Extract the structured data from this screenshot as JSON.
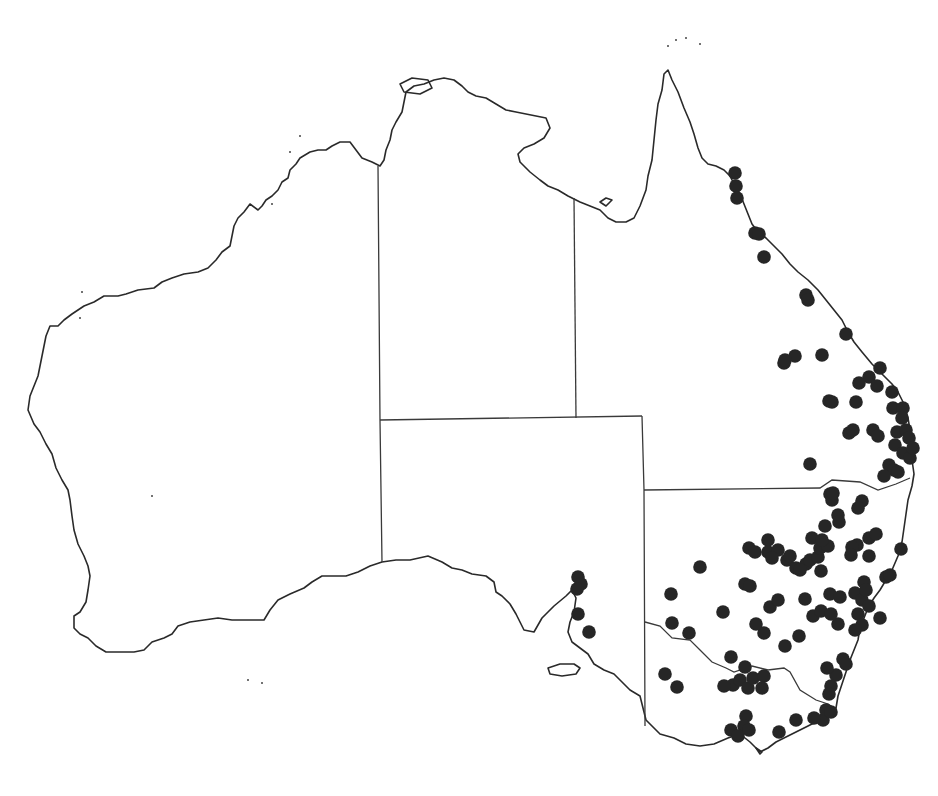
{
  "map": {
    "region": "Australia",
    "style": {
      "background": "#ffffff",
      "outline_color": "#2a2a2a",
      "dot_color": "#262626",
      "dot_radius": 6.8
    },
    "coastline": {
      "mainland": "M 380 166 L 372 162 L 362 158 L 356 150 L 350 142 L 340 142 L 332 146 L 326 150 L 318 150 L 310 152 L 300 158 L 296 164 L 290 170 L 288 178 L 282 182 L 278 190 L 272 196 L 266 200 L 262 206 L 258 210 L 250 204 L 244 212 L 238 218 L 234 226 L 232 236 L 230 246 L 222 252 L 216 260 L 208 268 L 198 272 L 184 274 L 172 278 L 162 282 L 154 288 L 138 290 L 126 294 L 118 296 L 104 296 L 94 302 L 84 306 L 72 314 L 64 320 L 58 326 L 50 326 L 46 336 L 44 346 L 42 356 L 40 366 L 38 376 L 34 386 L 30 396 L 28 410 L 34 424 L 40 432 L 46 444 L 52 454 L 56 468 L 62 480 L 68 490 L 70 500 L 72 516 L 74 530 L 78 544 L 84 556 L 88 566 L 90 576 L 88 590 L 86 602 L 80 612 L 74 616 L 74 628 L 80 634 L 88 638 L 96 646 L 106 652 L 120 652 L 134 652 L 144 650 L 152 642 L 164 638 L 172 634 L 178 626 L 190 622 L 204 620 L 218 618 L 232 620 L 248 620 L 264 620 L 270 610 L 278 600 L 290 594 L 304 588 L 312 582 L 322 576 L 334 576 L 346 576 L 358 572 L 370 566 L 382 562 L 396 560 L 410 560 L 428 556 L 442 562 L 452 568 L 462 570 L 472 574 L 486 576 L 494 582 L 496 592 L 502 596 L 510 604 L 516 614 L 520 622 L 524 630 L 534 632 L 542 618 L 554 606 L 566 596 L 572 590 L 576 598 L 574 612 L 570 622 L 568 632 L 572 642 L 580 648 L 588 654 L 594 664 L 604 670 L 614 674 L 622 682 L 630 690 L 640 696 L 646 720 L 660 734 L 674 738 L 686 744 L 700 746 L 714 744 L 728 738 L 740 734 L 750 742 L 760 752 L 768 748 L 776 742 L 788 736 L 800 730 L 812 724 L 822 720 L 830 716 L 836 708 L 838 696 L 842 684 L 846 672 L 850 660 L 854 650 L 858 640 L 860 628 L 864 618 L 868 608 L 874 598 L 880 590 L 886 580 L 892 570 L 898 556 L 902 542 L 904 528 L 906 514 L 908 500 L 912 486 L 914 474 L 912 460 L 912 444 L 910 430 L 908 418 L 904 404 L 898 392 L 892 384 L 882 374 L 872 364 L 862 352 L 854 342 L 848 332 L 842 320 L 834 310 L 826 300 L 818 290 L 808 280 L 798 272 L 790 264 L 782 254 L 774 246 L 766 238 L 758 232 L 752 224 L 748 214 L 744 204 L 740 194 L 734 184 L 730 176 L 724 170 L 716 166 L 708 164 L 702 158 L 698 148 L 694 134 L 690 122 L 684 108 L 678 92 L 672 80 L 668 70 L 664 74 L 662 90 L 658 104 L 656 120 L 654 140 L 652 160 L 648 176 L 646 190 L 640 206 L 634 218 L 626 222 L 616 222 L 608 218 L 600 210 L 590 206 L 580 202 L 568 196 L 558 190 L 548 186 L 540 180 L 530 172 L 520 162 L 518 154 L 524 148 L 534 144 L 544 138 L 550 128 L 546 118 L 536 116 L 526 114 L 516 112 L 506 110 L 496 104 L 486 98 L 476 96 L 468 92 L 462 86 L 454 80 L 444 78 L 434 80 L 424 84 L 414 86 L 406 92 L 404 102 L 402 112 L 396 122 L 392 130 L 390 140 L 386 150 L 384 160 Z",
      "kangaroo_island": "M 548 668 L 560 664 L 574 664 L 580 668 L 576 674 L 562 676 L 550 674 Z",
      "tasmania_tip": "M 756 748 L 760 754 L 762 752 Z",
      "gulf_islands": "M 600 202 L 606 198 L 612 200 L 606 206 Z",
      "tiwi_islands": "M 400 84 L 412 78 L 428 80 L 432 88 L 420 94 L 404 92 Z",
      "specks": [
        [
          668,
          46
        ],
        [
          676,
          40
        ],
        [
          686,
          38
        ],
        [
          700,
          44
        ],
        [
          82,
          292
        ],
        [
          80,
          318
        ],
        [
          152,
          496
        ],
        [
          248,
          680
        ],
        [
          262,
          683
        ],
        [
          300,
          136
        ],
        [
          290,
          152
        ],
        [
          272,
          204
        ]
      ]
    },
    "state_borders": [
      {
        "name": "wa-border",
        "d": "M 378 166 L 380 420 L 382 562"
      },
      {
        "name": "nt-sa-border",
        "d": "M 380 420 L 642 416"
      },
      {
        "name": "nt-qld-border",
        "d": "M 574 198 L 576 418"
      },
      {
        "name": "sa-east-border",
        "d": "M 642 416 L 644 490 L 645 726"
      },
      {
        "name": "qld-nsw-border",
        "d": "M 644 490 L 820 488 L 832 480 L 860 482 L 878 490 L 896 484 L 910 478"
      },
      {
        "name": "nsw-vic-border",
        "d": "M 645 622 L 660 626 L 672 638 L 690 640 L 700 650 L 712 662 L 726 668 L 734 672 L 752 666 L 768 670 L 784 668 L 790 672 L 800 690 L 816 700 L 828 704 L 834 708"
      }
    ],
    "occurrence_points": [
      [
        735,
        173
      ],
      [
        736,
        186
      ],
      [
        737,
        198
      ],
      [
        755,
        233
      ],
      [
        759,
        234
      ],
      [
        764,
        257
      ],
      [
        806,
        295
      ],
      [
        808,
        300
      ],
      [
        822,
        355
      ],
      [
        846,
        334
      ],
      [
        784,
        363
      ],
      [
        795,
        356
      ],
      [
        785,
        360
      ],
      [
        880,
        368
      ],
      [
        869,
        377
      ],
      [
        877,
        386
      ],
      [
        859,
        383
      ],
      [
        856,
        402
      ],
      [
        892,
        392
      ],
      [
        893,
        408
      ],
      [
        829,
        401
      ],
      [
        832,
        402
      ],
      [
        903,
        408
      ],
      [
        902,
        418
      ],
      [
        897,
        432
      ],
      [
        906,
        430
      ],
      [
        909,
        438
      ],
      [
        895,
        445
      ],
      [
        903,
        453
      ],
      [
        910,
        458
      ],
      [
        913,
        448
      ],
      [
        889,
        465
      ],
      [
        894,
        470
      ],
      [
        884,
        476
      ],
      [
        898,
        472
      ],
      [
        849,
        433
      ],
      [
        853,
        430
      ],
      [
        873,
        430
      ],
      [
        878,
        436
      ],
      [
        810,
        464
      ],
      [
        830,
        494
      ],
      [
        832,
        500
      ],
      [
        833,
        493
      ],
      [
        862,
        501
      ],
      [
        858,
        508
      ],
      [
        838,
        515
      ],
      [
        839,
        522
      ],
      [
        825,
        526
      ],
      [
        869,
        538
      ],
      [
        857,
        545
      ],
      [
        852,
        547
      ],
      [
        768,
        540
      ],
      [
        768,
        552
      ],
      [
        778,
        550
      ],
      [
        772,
        558
      ],
      [
        787,
        560
      ],
      [
        790,
        556
      ],
      [
        806,
        564
      ],
      [
        810,
        560
      ],
      [
        818,
        557
      ],
      [
        820,
        548
      ],
      [
        828,
        546
      ],
      [
        851,
        555
      ],
      [
        869,
        556
      ],
      [
        876,
        534
      ],
      [
        812,
        538
      ],
      [
        822,
        540
      ],
      [
        821,
        571
      ],
      [
        796,
        568
      ],
      [
        800,
        570
      ],
      [
        749,
        548
      ],
      [
        755,
        552
      ],
      [
        700,
        567
      ],
      [
        745,
        584
      ],
      [
        750,
        586
      ],
      [
        723,
        612
      ],
      [
        770,
        607
      ],
      [
        778,
        600
      ],
      [
        805,
        599
      ],
      [
        813,
        616
      ],
      [
        821,
        611
      ],
      [
        830,
        594
      ],
      [
        840,
        597
      ],
      [
        855,
        593
      ],
      [
        864,
        582
      ],
      [
        862,
        600
      ],
      [
        869,
        606
      ],
      [
        858,
        614
      ],
      [
        862,
        625
      ],
      [
        855,
        630
      ],
      [
        866,
        590
      ],
      [
        838,
        624
      ],
      [
        831,
        614
      ],
      [
        799,
        636
      ],
      [
        785,
        646
      ],
      [
        764,
        633
      ],
      [
        756,
        624
      ],
      [
        671,
        594
      ],
      [
        672,
        623
      ],
      [
        689,
        633
      ],
      [
        665,
        674
      ],
      [
        677,
        687
      ],
      [
        731,
        657
      ],
      [
        745,
        667
      ],
      [
        733,
        685
      ],
      [
        724,
        686
      ],
      [
        740,
        680
      ],
      [
        748,
        688
      ],
      [
        753,
        678
      ],
      [
        764,
        676
      ],
      [
        762,
        688
      ],
      [
        843,
        659
      ],
      [
        846,
        664
      ],
      [
        836,
        675
      ],
      [
        827,
        668
      ],
      [
        831,
        686
      ],
      [
        829,
        694
      ],
      [
        826,
        710
      ],
      [
        823,
        720
      ],
      [
        831,
        712
      ],
      [
        814,
        718
      ],
      [
        796,
        720
      ],
      [
        779,
        732
      ],
      [
        746,
        716
      ],
      [
        744,
        726
      ],
      [
        749,
        730
      ],
      [
        731,
        730
      ],
      [
        738,
        736
      ],
      [
        578,
        577
      ],
      [
        581,
        584
      ],
      [
        577,
        589
      ],
      [
        578,
        614
      ],
      [
        589,
        632
      ],
      [
        901,
        549
      ],
      [
        886,
        577
      ],
      [
        890,
        575
      ],
      [
        880,
        618
      ]
    ]
  }
}
